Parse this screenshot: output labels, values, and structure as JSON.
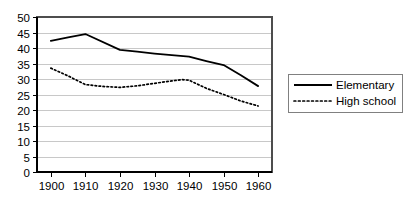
{
  "chart_data": {
    "type": "line",
    "title": "",
    "xlabel": "",
    "ylabel": "",
    "x": [
      1900,
      1910,
      1920,
      1930,
      1940,
      1950,
      1960
    ],
    "xlim": [
      1896,
      1964
    ],
    "ylim": [
      0,
      50
    ],
    "yticks": [
      0,
      5,
      10,
      15,
      20,
      25,
      30,
      35,
      40,
      45,
      50
    ],
    "xticks": [
      1900,
      1910,
      1920,
      1930,
      1940,
      1950,
      1960
    ],
    "grid": "horizontal",
    "legend_position": "right",
    "series": [
      {
        "name": "Elementary",
        "style": "solid",
        "color": "#000000",
        "x": [
          1900,
          1905,
          1910,
          1920,
          1925,
          1930,
          1935,
          1940,
          1945,
          1950,
          1955,
          1960
        ],
        "values": [
          42.3,
          43.4,
          44.5,
          39.4,
          38.8,
          38.2,
          37.7,
          37.2,
          35.8,
          34.5,
          31.2,
          27.7
        ]
      },
      {
        "name": "High school",
        "style": "dotted",
        "color": "#000000",
        "x": [
          1900,
          1905,
          1910,
          1915,
          1920,
          1925,
          1930,
          1935,
          1938,
          1940,
          1945,
          1950,
          1955,
          1960
        ],
        "values": [
          33.5,
          31.0,
          28.2,
          27.6,
          27.3,
          27.8,
          28.6,
          29.4,
          29.8,
          29.6,
          27.0,
          25.0,
          22.9,
          21.3
        ]
      }
    ]
  },
  "axis": {
    "y_tick_labels": [
      "50",
      "45",
      "40",
      "35",
      "30",
      "25",
      "20",
      "15",
      "10",
      "5",
      "0"
    ],
    "x_tick_labels": [
      "1900",
      "1910",
      "1920",
      "1930",
      "1940",
      "1950",
      "1960"
    ]
  },
  "legend": {
    "entries": [
      {
        "label": "Elementary",
        "style": "solid"
      },
      {
        "label": "High school",
        "style": "dotted"
      }
    ]
  },
  "colors": {
    "series": "#000000",
    "gridline": "#c8c8c8",
    "frame": "#4d4d4d",
    "legend_border": "#808080",
    "background": "#ffffff"
  }
}
